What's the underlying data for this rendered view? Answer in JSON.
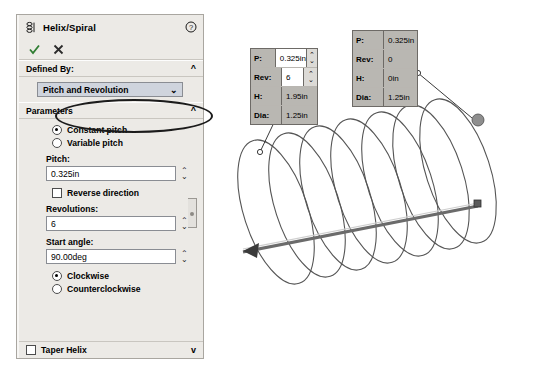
{
  "panel": {
    "title": "Helix/Spiral",
    "icon": "helix-icon",
    "help_icon": "help-icon",
    "accept_label": "OK",
    "cancel_label": "Cancel",
    "sections": {
      "defined_by": {
        "header": "Defined By:",
        "chevron": "^",
        "selected_option": "Pitch and Revolution"
      },
      "parameters": {
        "header": "Parameters",
        "chevron": "^",
        "pitch_mode": [
          {
            "label": "Constant pitch",
            "selected": true
          },
          {
            "label": "Variable pitch",
            "selected": false
          }
        ],
        "pitch": {
          "label": "Pitch:",
          "value": "0.325in"
        },
        "reverse_direction": {
          "label": "Reverse direction",
          "checked": false
        },
        "revolutions": {
          "label": "Revolutions:",
          "value": "6"
        },
        "start_angle": {
          "label": "Start angle:",
          "value": "90.00deg"
        },
        "direction": [
          {
            "label": "Clockwise",
            "selected": true
          },
          {
            "label": "Counterclockwise",
            "selected": false
          }
        ]
      },
      "taper_helix": {
        "label": "Taper Helix",
        "checked": false,
        "chevron": "v"
      }
    }
  },
  "graphics": {
    "callout_left": {
      "rows": [
        {
          "label": "P:",
          "value": "0.325in",
          "readonly": false
        },
        {
          "label": "Rev:",
          "value": "6",
          "readonly": false
        },
        {
          "label": "H:",
          "value": "1.95in",
          "readonly": true
        },
        {
          "label": "Dia:",
          "value": "1.25in",
          "readonly": true
        }
      ]
    },
    "callout_right": {
      "rows": [
        {
          "label": "P:",
          "value": "0.325in",
          "readonly": true
        },
        {
          "label": "Rev:",
          "value": "0",
          "readonly": true
        },
        {
          "label": "H:",
          "value": "0in",
          "readonly": true
        },
        {
          "label": "Dia:",
          "value": "1.25in",
          "readonly": true
        }
      ]
    },
    "preview": {
      "name": "helix-preview",
      "loops": 6,
      "axis_arrow": "axis-arrow"
    }
  },
  "colors": {
    "panel_bg": "#eceae6",
    "combo_bg": "#cfd4dd",
    "callout_grey": "#b9b7b2",
    "check_green": "#2f7d32",
    "cancel_red": "#333333"
  }
}
